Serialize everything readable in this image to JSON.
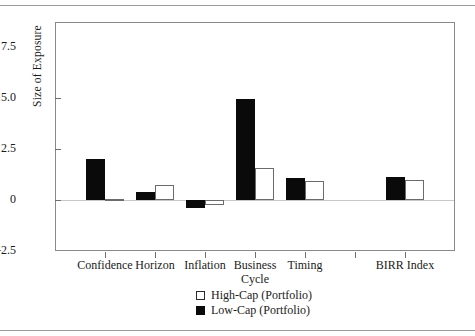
{
  "chart_data": {
    "type": "bar",
    "title": "",
    "xlabel": "",
    "ylabel": "Size of Exposure",
    "ylim": [
      -2.5,
      7.5
    ],
    "yticks": [
      "7.5",
      "5.0",
      "2.5",
      "0",
      "-2.5"
    ],
    "ytick_values": [
      7.5,
      5.0,
      2.5,
      0,
      -2.5
    ],
    "grid": false,
    "legend_position": "bottom-center",
    "categories": [
      "Confidence",
      "Horizon",
      "Inflation",
      "Business\nCycle",
      "Timing",
      "",
      "BIRR Index"
    ],
    "category_labels": [
      {
        "line1": "Confidence",
        "line2": ""
      },
      {
        "line1": "Horizon",
        "line2": ""
      },
      {
        "line1": "Inflation",
        "line2": ""
      },
      {
        "line1": "Business",
        "line2": "Cycle"
      },
      {
        "line1": "Timing",
        "line2": ""
      },
      {
        "line1": "",
        "line2": ""
      },
      {
        "line1": "BIRR Index",
        "line2": ""
      }
    ],
    "series": [
      {
        "name": "High-Cap (Portfolio)",
        "color": "#ffffff",
        "edgecolor": "#6b6b6b",
        "values": [
          0.05,
          0.75,
          -0.25,
          1.55,
          0.95,
          null,
          1.0
        ]
      },
      {
        "name": "Low-Cap (Portfolio)",
        "color": "#0a0a0a",
        "edgecolor": "#0a0a0a",
        "values": [
          2.0,
          0.4,
          -0.4,
          4.95,
          1.1,
          null,
          1.15
        ]
      }
    ]
  },
  "legend": {
    "items": [
      {
        "label": "High-Cap (Portfolio)",
        "swatch": "high"
      },
      {
        "label": "Low-Cap (Portfolio)",
        "swatch": "low"
      }
    ]
  }
}
